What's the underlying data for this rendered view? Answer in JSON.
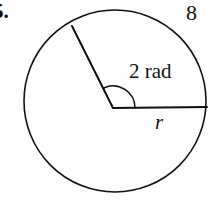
{
  "figure": {
    "kind": "geometry-diagram",
    "background_color": "#fefefe",
    "stroke_color": "#111111",
    "problem_number": "5.",
    "labels": {
      "arc_length": "8",
      "angle": "2 rad",
      "radius": "r"
    },
    "geometry": {
      "circle": {
        "center_x": 115,
        "center_y": 101,
        "radius": 91,
        "stroke_width": 1.6
      },
      "vertex": {
        "x": 113,
        "y": 108
      },
      "horizontal_radius": {
        "from_x": 113,
        "from_y": 108,
        "to_x": 207,
        "to_y": 107,
        "stroke_width": 2.0
      },
      "slanted_radius": {
        "from_x": 113,
        "from_y": 108,
        "to_x": 72,
        "to_y": 26,
        "angle_radians": 2,
        "stroke_width": 2.0
      },
      "angle_arc": {
        "radius": 22,
        "start_x": 135,
        "start_y": 108,
        "end_x": 103,
        "end_y": 88,
        "stroke_width": 1.5
      }
    }
  }
}
